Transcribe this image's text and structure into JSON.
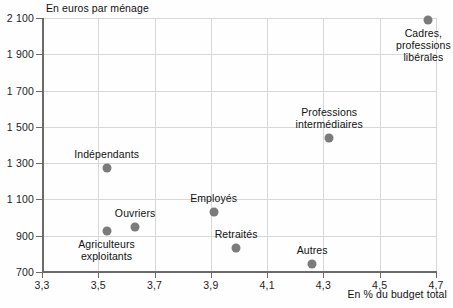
{
  "chart_data": {
    "type": "scatter",
    "title": "",
    "ylabel": "En euros par ménage",
    "xlabel": "En % du budget total",
    "xlim": [
      3.3,
      4.7
    ],
    "ylim": [
      700,
      2100
    ],
    "xticks": [
      "3,3",
      "3,5",
      "3,7",
      "3,9",
      "4,1",
      "4,3",
      "4,5",
      "4,7"
    ],
    "xtick_values": [
      3.3,
      3.5,
      3.7,
      3.9,
      4.1,
      4.3,
      4.5,
      4.7
    ],
    "yticks": [
      "700",
      "900",
      "1 100",
      "1 300",
      "1 500",
      "1 700",
      "1 900",
      "2 100"
    ],
    "ytick_values": [
      700,
      900,
      1100,
      1300,
      1500,
      1700,
      1900,
      2100
    ],
    "grid": true,
    "legend": "none",
    "marker_color": "#7b7b7b",
    "points": [
      {
        "label": "Indépendants",
        "x": 3.53,
        "y": 1275,
        "label_lines": [
          "Indépendants"
        ],
        "label_pos": "above"
      },
      {
        "label": "Agriculteurs exploitants",
        "x": 3.53,
        "y": 925,
        "label_lines": [
          "Agriculteurs",
          "exploitants"
        ],
        "label_pos": "below"
      },
      {
        "label": "Ouvriers",
        "x": 3.63,
        "y": 950,
        "label_lines": [
          "Ouvriers"
        ],
        "label_pos": "above"
      },
      {
        "label": "Employés",
        "x": 3.91,
        "y": 1030,
        "label_lines": [
          "Employés"
        ],
        "label_pos": "above"
      },
      {
        "label": "Retraités",
        "x": 3.99,
        "y": 830,
        "label_lines": [
          "Retraités"
        ],
        "label_pos": "above"
      },
      {
        "label": "Autres",
        "x": 4.26,
        "y": 745,
        "label_lines": [
          "Autres"
        ],
        "label_pos": "above"
      },
      {
        "label": "Professions intermédiaires",
        "x": 4.32,
        "y": 1440,
        "label_lines": [
          "Professions",
          "intermédiaires"
        ],
        "label_pos": "above"
      },
      {
        "label": "Cadres, professions libérales",
        "x": 4.67,
        "y": 2090,
        "label_lines": [
          "Cadres,",
          "professions",
          "libérales"
        ],
        "label_pos": "below"
      }
    ]
  }
}
